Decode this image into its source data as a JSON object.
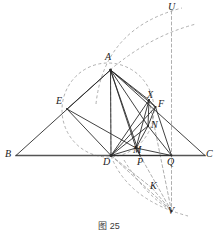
{
  "figure": {
    "caption": "图 25",
    "caption_y": 219,
    "width": 218,
    "height": 230,
    "background": "#ffffff",
    "solid_stroke": "#2b2b2b",
    "dashed_stroke": "#9a9a9a",
    "baseline_stroke": "#555555"
  },
  "points": [
    {
      "id": "A",
      "label": "A",
      "x": 110.5,
      "y": 70.0,
      "lx": 105,
      "ly": 52
    },
    {
      "id": "B",
      "label": "B",
      "x": 16.0,
      "y": 155.5,
      "lx": 5,
      "ly": 149
    },
    {
      "id": "C",
      "label": "C",
      "x": 205.0,
      "y": 155.5,
      "lx": 206,
      "ly": 149
    },
    {
      "id": "D",
      "label": "D",
      "x": 111.0,
      "y": 155.5,
      "lx": 103,
      "ly": 157
    },
    {
      "id": "E",
      "label": "E",
      "x": 67.0,
      "y": 109.0,
      "lx": 56,
      "ly": 96
    },
    {
      "id": "F",
      "label": "F",
      "x": 155.5,
      "y": 107.0,
      "lx": 158,
      "ly": 99
    },
    {
      "id": "X",
      "label": "X",
      "x": 149.0,
      "y": 100.0,
      "lx": 147,
      "ly": 90
    },
    {
      "id": "N",
      "label": "N",
      "x": 148.0,
      "y": 126.0,
      "lx": 151,
      "ly": 120
    },
    {
      "id": "M",
      "label": "M",
      "x": 136.0,
      "y": 148.0,
      "lx": 133,
      "ly": 145
    },
    {
      "id": "P",
      "label": "P",
      "x": 140.0,
      "y": 155.5,
      "lx": 137,
      "ly": 157
    },
    {
      "id": "Q",
      "label": "Q",
      "x": 171.5,
      "y": 155.5,
      "lx": 167,
      "ly": 157
    },
    {
      "id": "U",
      "label": "U",
      "x": 171.5,
      "y": 11.0,
      "lx": 168,
      "ly": 2
    },
    {
      "id": "V",
      "label": "V",
      "x": 171.5,
      "y": 211.0,
      "lx": 168,
      "ly": 206
    },
    {
      "id": "K",
      "label": "K",
      "x": 152.0,
      "y": 188.0,
      "lx": 150,
      "ly": 181
    }
  ],
  "solid_segments": [
    {
      "name": "segment-BC",
      "from": "B",
      "to": "C"
    },
    {
      "name": "segment-BA",
      "from": "B",
      "to": "A"
    },
    {
      "name": "segment-AC",
      "from": "A",
      "to": "C"
    },
    {
      "name": "segment-AD",
      "from": "A",
      "to": "D"
    },
    {
      "name": "segment-AM",
      "from": "A",
      "to": "M"
    },
    {
      "name": "segment-AP",
      "from": "A",
      "to": "P"
    },
    {
      "name": "segment-AN",
      "from": "A",
      "to": "N"
    },
    {
      "name": "segment-AX",
      "from": "A",
      "to": "X"
    },
    {
      "name": "segment-AF",
      "from": "A",
      "to": "F"
    },
    {
      "name": "segment-AE",
      "from": "A",
      "to": "E"
    },
    {
      "name": "segment-ED",
      "from": "E",
      "to": "D"
    },
    {
      "name": "segment-EM",
      "from": "E",
      "to": "M"
    },
    {
      "name": "segment-DX",
      "from": "D",
      "to": "X"
    },
    {
      "name": "segment-DF",
      "from": "D",
      "to": "F"
    },
    {
      "name": "segment-DN",
      "from": "D",
      "to": "N"
    },
    {
      "name": "segment-DM",
      "from": "D",
      "to": "M"
    },
    {
      "name": "segment-DQ2",
      "from": "D",
      "to": "Q"
    },
    {
      "name": "segment-XF",
      "from": "X",
      "to": "F"
    },
    {
      "name": "segment-XN",
      "from": "X",
      "to": "N"
    },
    {
      "name": "segment-XM",
      "from": "X",
      "to": "M"
    },
    {
      "name": "segment-FN",
      "from": "F",
      "to": "N"
    },
    {
      "name": "segment-FQ",
      "from": "F",
      "to": "Q"
    },
    {
      "name": "segment-NM",
      "from": "N",
      "to": "M"
    },
    {
      "name": "segment-NQ",
      "from": "N",
      "to": "Q"
    },
    {
      "name": "segment-MQ",
      "from": "M",
      "to": "Q"
    },
    {
      "name": "segment-MP",
      "from": "M",
      "to": "P"
    }
  ],
  "dashed_segments": [
    {
      "name": "dashed-AD-vertical",
      "from": "A",
      "to": "D"
    },
    {
      "name": "dashed-UV-vertical",
      "from": "U",
      "to": "V"
    },
    {
      "name": "dashed-PV",
      "from": "P",
      "to": "V"
    },
    {
      "name": "dashed-DV",
      "from": "D",
      "to": "V"
    },
    {
      "name": "dashed-KV",
      "from": "K",
      "to": "V"
    },
    {
      "name": "dashed-XV",
      "from": "X",
      "to": "V"
    },
    {
      "name": "dashed-DK",
      "from": "D",
      "to": "K"
    }
  ],
  "circles": [
    {
      "name": "circle-AED",
      "cx": 108,
      "cy": 110,
      "rx": 46,
      "ry": 47
    }
  ],
  "arcs": [
    {
      "name": "arc-upper-outer",
      "d": "M 96 104 Q 104 28 182 8"
    },
    {
      "name": "arc-upper-inner",
      "d": "M 110 70 Q 150 36 196 24"
    },
    {
      "name": "arc-lower-outer",
      "d": "M 111 156 Q 128 200 188 216"
    },
    {
      "name": "arc-lower-inner",
      "d": "M 124 160 Q 146 196 172 211"
    }
  ],
  "labels_meta": {
    "font_style": "italic",
    "font_size_px": 10
  }
}
